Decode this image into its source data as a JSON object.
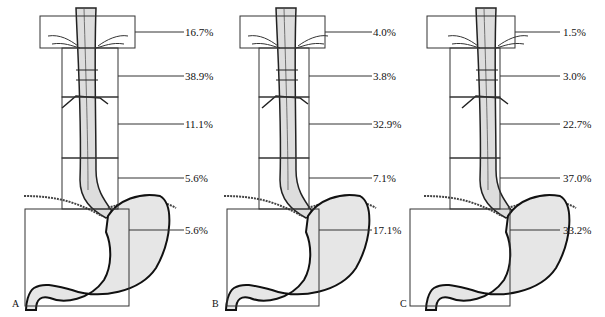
{
  "figure": {
    "panels": [
      {
        "label": "A",
        "percentages": {
          "pharyngoesophageal": "16.7%",
          "upper_thoracic": "38.9%",
          "middle_thoracic": "11.1%",
          "lower_thoracic": "5.6%",
          "cardia_stomach": "5.6%"
        }
      },
      {
        "label": "B",
        "percentages": {
          "pharyngoesophageal": "4.0%",
          "upper_thoracic": "3.8%",
          "middle_thoracic": "32.9%",
          "lower_thoracic": "7.1%",
          "cardia_stomach": "17.1%"
        }
      },
      {
        "label": "C",
        "percentages": {
          "pharyngoesophageal": "1.5%",
          "upper_thoracic": "3.0%",
          "middle_thoracic": "22.7%",
          "lower_thoracic": "37.0%",
          "cardia_stomach": "33.2%"
        }
      }
    ]
  }
}
